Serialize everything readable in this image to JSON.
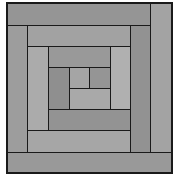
{
  "title": "Log cabin quilt block",
  "colors": {
    "line": "#1a1a1a",
    "dark": "#8e8e8e",
    "medium": "#9c9c9c",
    "light": "#acacac",
    "background": "#ffffff"
  },
  "pieces": [
    {
      "id": "ring1-top",
      "x": 7,
      "y": 3,
      "w": 144,
      "h": 23,
      "color": "#959595"
    },
    {
      "id": "ring1-right",
      "x": 150,
      "y": 3,
      "w": 22,
      "h": 150,
      "color": "#a3a3a3"
    },
    {
      "id": "ring1-bottom",
      "x": 7,
      "y": 152,
      "w": 165,
      "h": 21,
      "color": "#999999"
    },
    {
      "id": "ring1-left",
      "x": 7,
      "y": 25,
      "w": 21,
      "h": 128,
      "color": "#9d9d9d"
    },
    {
      "id": "ring2-top",
      "x": 27,
      "y": 25,
      "w": 104,
      "h": 22,
      "color": "#a2a2a2"
    },
    {
      "id": "ring2-right",
      "x": 130,
      "y": 25,
      "w": 21,
      "h": 128,
      "color": "#929292"
    },
    {
      "id": "ring2-bottom",
      "x": 27,
      "y": 130,
      "w": 104,
      "h": 23,
      "color": "#a6a6a6"
    },
    {
      "id": "ring2-left",
      "x": 27,
      "y": 46,
      "w": 22,
      "h": 85,
      "color": "#ababab"
    },
    {
      "id": "ring3-top",
      "x": 48,
      "y": 46,
      "w": 63,
      "h": 22,
      "color": "#999999"
    },
    {
      "id": "ring3-right",
      "x": 110,
      "y": 46,
      "w": 21,
      "h": 64,
      "color": "#b0b0b0"
    },
    {
      "id": "ring3-bottom",
      "x": 48,
      "y": 109,
      "w": 83,
      "h": 22,
      "color": "#939393"
    },
    {
      "id": "ring3-left",
      "x": 48,
      "y": 67,
      "w": 22,
      "h": 43,
      "color": "#8f8f8f"
    },
    {
      "id": "ring4-bottom",
      "x": 69,
      "y": 88,
      "w": 42,
      "h": 22,
      "color": "#a9a9a9"
    },
    {
      "id": "center",
      "x": 69,
      "y": 67,
      "w": 21,
      "h": 22,
      "color": "#a5a5a5"
    },
    {
      "id": "ring4-right",
      "x": 89,
      "y": 67,
      "w": 22,
      "h": 22,
      "color": "#959595"
    }
  ]
}
